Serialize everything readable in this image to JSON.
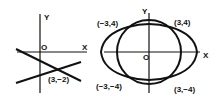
{
  "left_figure": {
    "y_label": "Y",
    "x_label": "X",
    "origin_label": "O",
    "intersection_label": "(3,−2)"
  },
  "right_figure": {
    "y_label": "Y",
    "x_label": "X",
    "origin_label": "O",
    "points": [
      "(−3,4)",
      "(3,4)",
      "(−3,−4)",
      "(3,−4)"
    ]
  }
}
